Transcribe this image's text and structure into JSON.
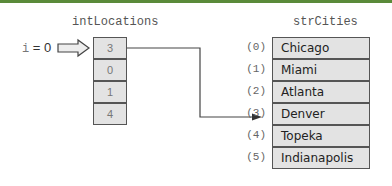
{
  "left_array": {
    "title": "intLocations",
    "values": [
      "3",
      "0",
      "1",
      "4"
    ]
  },
  "right_array": {
    "title": "strCities",
    "indices": [
      "(0)",
      "(1)",
      "(2)",
      "(3)",
      "(4)",
      "(5)"
    ],
    "values": [
      "Chicago",
      "Miami",
      "Atlanta",
      "Denver",
      "Topeka",
      "Indianapolis"
    ]
  },
  "pointer": {
    "var": "i",
    "eq": " = 0"
  },
  "colors": {
    "top_bar": "#5a8a3a",
    "cell_fill": "#e3e3e3",
    "cell_border": "#555555"
  }
}
